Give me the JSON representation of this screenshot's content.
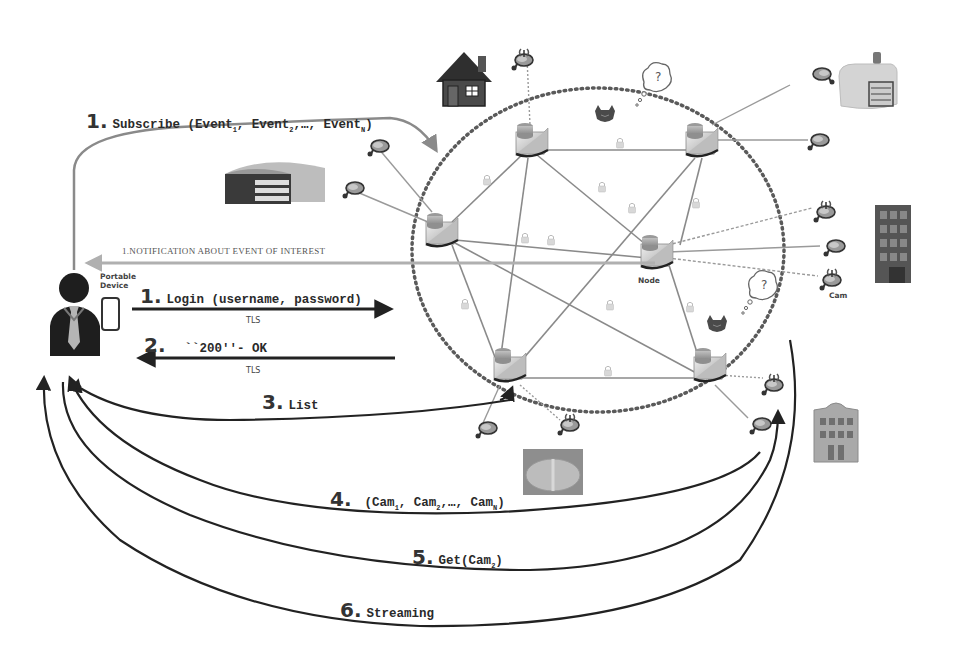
{
  "diagram": {
    "actors": {
      "user": {
        "label": "User",
        "icon": "businessman-icon"
      },
      "device": {
        "label": "Portable\nDevice",
        "label_line1": "Portable",
        "label_line2": "Device",
        "icon": "smartphone-icon"
      }
    },
    "network": {
      "node_label": "Node",
      "cam_label": "Cam",
      "nodes": [
        {
          "id": "n1",
          "x": 530,
          "y": 140
        },
        {
          "id": "n2",
          "x": 700,
          "y": 140
        },
        {
          "id": "n3",
          "x": 440,
          "y": 228
        },
        {
          "id": "n4",
          "x": 658,
          "y": 250
        },
        {
          "id": "n5",
          "x": 510,
          "y": 362
        },
        {
          "id": "n6",
          "x": 710,
          "y": 362
        }
      ],
      "links": [
        [
          "n1",
          "n2"
        ],
        [
          "n1",
          "n3"
        ],
        [
          "n1",
          "n4"
        ],
        [
          "n1",
          "n5"
        ],
        [
          "n2",
          "n4"
        ],
        [
          "n2",
          "n5"
        ],
        [
          "n3",
          "n4"
        ],
        [
          "n3",
          "n5"
        ],
        [
          "n3",
          "n6"
        ],
        [
          "n4",
          "n6"
        ],
        [
          "n5",
          "n6"
        ]
      ]
    },
    "messages": [
      {
        "step": "1.",
        "text": "Subscribe (Event",
        "sub1": "1",
        "mid1": ", Event",
        "sub2": "2",
        "mid2": ",…, Event",
        "sub3": "N",
        "tail": ")"
      },
      {
        "step": "",
        "text": "1.NOTIFICATION ABOUT EVENT OF INTEREST"
      },
      {
        "step": "1.",
        "text": "Login (username, password)",
        "channel": "TLS"
      },
      {
        "step": "2.",
        "text": "``200''- OK",
        "channel": "TLS"
      },
      {
        "step": "3.",
        "text": "List"
      },
      {
        "step": "4.",
        "text": "(Cam",
        "sub1": "1",
        "mid1": ", Cam",
        "sub2": "2",
        "mid2": ",…, Cam",
        "sub3": "N",
        "tail": ")"
      },
      {
        "step": "5.",
        "text": "Get(Cam",
        "sub1": "2",
        "tail": ")"
      },
      {
        "step": "6.",
        "text": "Streaming"
      }
    ],
    "decorations": [
      "house-icon",
      "warehouse-icon",
      "factory-icon",
      "office-tower-icon",
      "townhouse-icon",
      "stadium-icon",
      "attacker-icon",
      "thought-bubble-icon"
    ],
    "colors": {
      "ink": "#2a2a2a",
      "gray_line": "#8a8a8a",
      "dotted": "#6a6a6a",
      "notif_arrow": "#a8a8a8"
    }
  }
}
